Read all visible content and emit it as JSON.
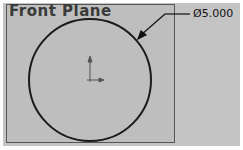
{
  "plane": {
    "label": "Front Plane"
  },
  "dimension": {
    "symbol": "Ø",
    "value": "5.000",
    "text": "Ø5.000"
  },
  "sketch": {
    "entity": "circle",
    "center": [
      90,
      80
    ],
    "radius": 61,
    "line_color": "#1a1a1a",
    "background_color": "#c0c0c0"
  },
  "origin": {
    "icon": "origin-axes-icon"
  }
}
